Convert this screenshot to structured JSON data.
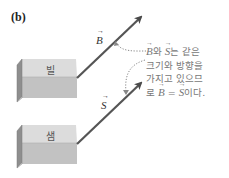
{
  "figure": {
    "panel_label": "(b)",
    "blocks": [
      {
        "label": "빌",
        "name": "bill"
      },
      {
        "label": "샘",
        "name": "sam"
      }
    ],
    "vectors": [
      {
        "symbol": "B",
        "from_block": "bill"
      },
      {
        "symbol": "S",
        "from_block": "sam"
      }
    ],
    "annotation": {
      "line1_v1": "B",
      "line1_mid": "와 ",
      "line1_v2": "S",
      "line1_end": "는 같은",
      "line2": "크기와 방향을",
      "line3": "가지고 있으므",
      "line4_pre": "로 ",
      "line4_v1": "B",
      "line4_eq": " = ",
      "line4_v2": "S",
      "line4_end": "이다."
    },
    "colors": {
      "arrow": "#555555",
      "block_top": "#d9d9d9",
      "block_front": "#c4c4c4",
      "block_side": "#8e8e8e",
      "text": "#777777",
      "dotted_leader": "#888888"
    }
  }
}
